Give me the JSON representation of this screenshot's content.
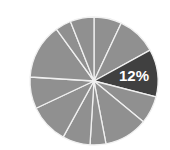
{
  "chart_data": {
    "type": "pie",
    "title": "",
    "categories": [
      "S1",
      "S2",
      "S3",
      "S4",
      "S5",
      "S6",
      "S7",
      "S8",
      "S9",
      "S10",
      "S11",
      "S12"
    ],
    "values": [
      7,
      10,
      12,
      7,
      11,
      4,
      7,
      10,
      8,
      14,
      4,
      6
    ],
    "start_angle_deg": 0,
    "direction": "clockwise",
    "highlight_index": 2,
    "data_labels": [
      {
        "index": 2,
        "text": "12%"
      }
    ],
    "legend": "none",
    "colors": {
      "default": "#909090",
      "highlight": "#404040",
      "separator": "#f0f0f0",
      "label_text": "#ffffff"
    },
    "geometry": {
      "cx": 94,
      "cy": 81,
      "r": 64
    }
  }
}
